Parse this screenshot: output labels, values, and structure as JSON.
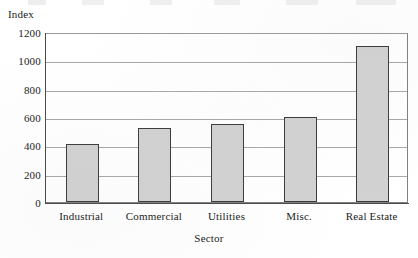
{
  "chart_data": {
    "type": "bar",
    "title": "",
    "subtitle": "",
    "xlabel": "Sector",
    "ylabel": "Index",
    "categories": [
      "Industrial",
      "Commercial",
      "Utilities",
      "Misc.",
      "Real Estate"
    ],
    "values": [
      410,
      520,
      550,
      600,
      1100
    ],
    "series": [
      {
        "name": "Index",
        "values": [
          410,
          520,
          550,
          600,
          1100
        ]
      }
    ],
    "ylim": [
      0,
      1200
    ],
    "ytick_labels": [
      "1200",
      "1000",
      "800",
      "600",
      "400",
      "200",
      "0"
    ],
    "ytick_values": [
      1200,
      1000,
      800,
      600,
      400,
      200,
      0
    ],
    "ytick_step": 200,
    "grid": "horizontal",
    "legend": "none",
    "bar_fill_color": "#d2d2d2",
    "bar_border_color": "#3c3c3c",
    "gridline_color": "#a8a8a8",
    "axis_color": "#4a4a4a",
    "background_color": "#ffffff",
    "annotations": []
  }
}
